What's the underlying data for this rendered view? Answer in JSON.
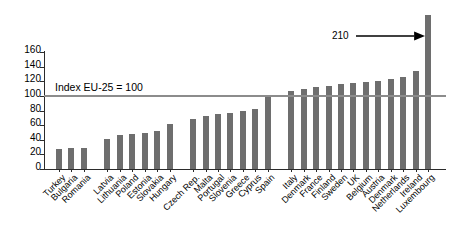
{
  "chart_data": {
    "type": "bar",
    "title": "",
    "subtitle": "",
    "xlabel": "",
    "ylabel": "",
    "ylim": [
      0,
      160
    ],
    "ytick_step": 20,
    "yticks": [
      0,
      20,
      40,
      60,
      80,
      100,
      120,
      140,
      160
    ],
    "grid": false,
    "legend": null,
    "bar_color": "#6e6e6e",
    "reference_line": {
      "value": 100,
      "label": "Index EU-25 = 100",
      "color": "#8c8c8c"
    },
    "annotations": [
      {
        "text": "210",
        "points_to": "Luxembourg",
        "note": "arrow pointing to clipped Luxembourg bar"
      }
    ],
    "groups": [
      {
        "name": "candidate-countries",
        "categories": [
          "Turkey",
          "Bulgaria",
          "Romania"
        ],
        "values": [
          27,
          29,
          29
        ]
      },
      {
        "name": "lower-income-members",
        "categories": [
          "Latvia",
          "Lithuania",
          "Poland",
          "Estonia",
          "Slovakia",
          "Hungary"
        ],
        "values": [
          41,
          46,
          48,
          49,
          52,
          61
        ]
      },
      {
        "name": "mid-income-members",
        "categories": [
          "Czech Rep.",
          "Malta",
          "Portugal",
          "Slovenia",
          "Greece",
          "Cyprus",
          "Spain"
        ],
        "values": [
          68,
          72,
          75,
          76,
          80,
          82,
          100
        ]
      },
      {
        "name": "higher-income-members",
        "categories": [
          "Italy",
          "Denmark",
          "France",
          "Finland",
          "Sweden",
          "UK",
          "Belgium",
          "Austria",
          "Denmark",
          "Netherlands",
          "Ireland",
          "Luxembourg"
        ],
        "values": [
          106,
          110,
          112,
          113,
          116,
          118,
          119,
          121,
          123,
          126,
          134,
          210
        ]
      }
    ],
    "categories": [
      "Turkey",
      "Bulgaria",
      "Romania",
      "Latvia",
      "Lithuania",
      "Poland",
      "Estonia",
      "Slovakia",
      "Hungary",
      "Czech Rep.",
      "Malta",
      "Portugal",
      "Slovenia",
      "Greece",
      "Cyprus",
      "Spain",
      "Italy",
      "Denmark",
      "France",
      "Finland",
      "Sweden",
      "UK",
      "Belgium",
      "Austria",
      "Denmark",
      "Netherlands",
      "Ireland",
      "Luxembourg"
    ],
    "values": [
      27,
      29,
      29,
      41,
      46,
      48,
      49,
      52,
      61,
      68,
      72,
      75,
      76,
      80,
      82,
      100,
      106,
      110,
      112,
      113,
      116,
      118,
      119,
      121,
      123,
      126,
      134,
      210
    ]
  }
}
